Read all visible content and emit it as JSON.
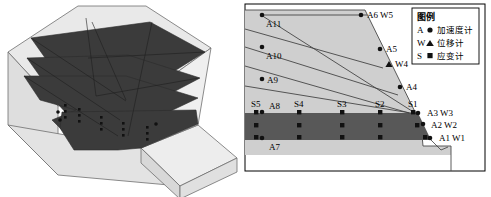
{
  "figure": {
    "panels": [
      "left-3d-model",
      "right-cross-section"
    ]
  },
  "left_panel": {
    "name": "3D isometric slope model",
    "colors": {
      "body_fill": "#d9d9d9",
      "body_top_fill": "#e8e8e8",
      "layer_fill": "#3a3a3a",
      "outline": "#555555",
      "sensor_dot": "#111111"
    },
    "layer_count": 4,
    "sensor_dot_rows": 2
  },
  "right_panel": {
    "name": "Cross-section with sensor layout",
    "colors": {
      "soil_fill": "#cfcfcf",
      "band_fill": "#585858",
      "frame_stroke": "#000000",
      "line_stroke": "#404040",
      "marker_fill": "#111111"
    },
    "slip_lines": 5,
    "labels": {
      "a11": "A11",
      "a10": "A10",
      "a9": "A9",
      "a6w5": "A6 W5",
      "a5": "A5",
      "w4": "W4",
      "a4": "A4",
      "s5": "S5",
      "a8": "A8",
      "s4": "S4",
      "s3": "S3",
      "s2": "S2",
      "s1": "S1",
      "a3w3": "A3 W3",
      "a2w2": "A2 W2",
      "a1w1": "A1 W1",
      "a7": "A7"
    }
  },
  "legend": {
    "title": "图例",
    "entries": [
      {
        "key": "A",
        "marker": "circle-marker",
        "label": "加速度计"
      },
      {
        "key": "W",
        "marker": "triangle-marker",
        "label": "位移计"
      },
      {
        "key": "S",
        "marker": "square-marker",
        "label": "应变计"
      }
    ]
  },
  "sensors": {
    "accelerometers": [
      "A1",
      "A2",
      "A3",
      "A4",
      "A5",
      "A6",
      "A7",
      "A8",
      "A9",
      "A10",
      "A11"
    ],
    "displacement_meters": [
      "W1",
      "W2",
      "W3",
      "W4",
      "W5"
    ],
    "strain_gauges": [
      "S1",
      "S2",
      "S3",
      "S4",
      "S5"
    ]
  }
}
